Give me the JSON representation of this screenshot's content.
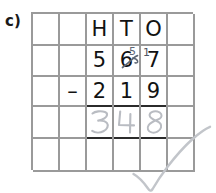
{
  "exercise": {
    "label": "c)"
  },
  "colors": {
    "grid_line": "#9a9a9a",
    "working_rule": "#2b2b2b",
    "printed_ink": "#121212",
    "pencil": "#b9bcc2",
    "borrow_ink": "#5d6775",
    "tick": "#c2c5ca",
    "page": "#ffffff"
  },
  "grid": {
    "columns": 6,
    "rows": 5,
    "headers": [
      "",
      "",
      "H",
      "T",
      "O",
      ""
    ],
    "rows_data": [
      {
        "name": "header-row",
        "cells": [
          "",
          "",
          "H",
          "T",
          "O",
          ""
        ]
      },
      {
        "name": "minuend-row",
        "cells": [
          "",
          "",
          "5",
          "6",
          "7",
          ""
        ]
      },
      {
        "name": "subtrahend-row",
        "cells": [
          "",
          "–",
          "2",
          "1",
          "9",
          ""
        ]
      },
      {
        "name": "answer-row",
        "cells": [
          "",
          "",
          "3",
          "4",
          "8",
          ""
        ]
      },
      {
        "name": "blank-row",
        "cells": [
          "",
          "",
          "",
          "",
          "",
          ""
        ]
      }
    ]
  },
  "annotations": {
    "borrow_tens_new_value": "5",
    "borrow_tens_struck_value": "6",
    "borrow_ones_carry": "1",
    "answer_digits": [
      "3",
      "4",
      "8"
    ],
    "tick": "correct-tick"
  },
  "calculation": {
    "minuend": "567",
    "operator": "–",
    "subtrahend": "219",
    "answer": "348",
    "place_value_headers": [
      "H",
      "T",
      "O"
    ]
  }
}
